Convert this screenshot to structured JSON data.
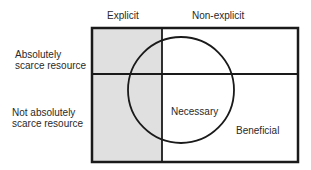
{
  "columns": {
    "explicit": "Explicit",
    "non_explicit": "Non-explicit"
  },
  "rows": {
    "scarce_line1": "Absolutely",
    "scarce_line2": "scarce resource",
    "not_scarce_line1": "Not absolutely",
    "not_scarce_line2": "scarce resource"
  },
  "regions": {
    "circle": "Necessary",
    "outer": "Beneficial"
  },
  "colors": {
    "shaded": "#e0e0e0",
    "line": "#1a1a1a",
    "background": "#ffffff"
  }
}
